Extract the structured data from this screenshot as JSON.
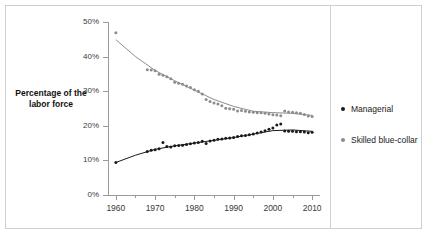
{
  "title_fragment": "UNEQUAL",
  "y_axis_title": "Percentage of the labor force",
  "legend": {
    "items": [
      {
        "label": "Managerial",
        "color": "#1a1a1a",
        "marker": "dot-marker"
      },
      {
        "label": "Skilled blue-collar",
        "color": "#8c8c8c",
        "marker": "dot-marker"
      }
    ]
  },
  "chart_data": {
    "type": "scatter",
    "title": "",
    "xlabel": "",
    "ylabel": "Percentage of the labor force",
    "xlim": [
      1958,
      2012
    ],
    "ylim": [
      0,
      50
    ],
    "grid": false,
    "legend_position": "right",
    "x_ticks": [
      1960,
      1970,
      1980,
      1990,
      2000,
      2010
    ],
    "x_tick_labels": [
      "1960",
      "1970",
      "1980",
      "1990",
      "2000",
      "2010"
    ],
    "x_minor_ticks": [
      1965,
      1975,
      1985,
      1995,
      2005
    ],
    "y_ticks": [
      0,
      10,
      20,
      30,
      40,
      50
    ],
    "y_tick_labels": [
      "0%",
      "10%",
      "20%",
      "30%",
      "40%",
      "50%"
    ],
    "series": [
      {
        "name": "Skilled blue-collar",
        "color": "#8c8c8c",
        "marker": "dot",
        "trend_line": true,
        "points": [
          {
            "x": 1960,
            "y": 46.9
          },
          {
            "x": 1968,
            "y": 36.2
          },
          {
            "x": 1969,
            "y": 36.1
          },
          {
            "x": 1970,
            "y": 35.9
          },
          {
            "x": 1971,
            "y": 34.9
          },
          {
            "x": 1972,
            "y": 34.6
          },
          {
            "x": 1973,
            "y": 34.2
          },
          {
            "x": 1974,
            "y": 33.6
          },
          {
            "x": 1975,
            "y": 32.6
          },
          {
            "x": 1976,
            "y": 32.3
          },
          {
            "x": 1977,
            "y": 32.0
          },
          {
            "x": 1978,
            "y": 31.5
          },
          {
            "x": 1979,
            "y": 31.1
          },
          {
            "x": 1980,
            "y": 30.4
          },
          {
            "x": 1981,
            "y": 30.0
          },
          {
            "x": 1982,
            "y": 29.2
          },
          {
            "x": 1983,
            "y": 27.6
          },
          {
            "x": 1984,
            "y": 27.0
          },
          {
            "x": 1985,
            "y": 26.6
          },
          {
            "x": 1986,
            "y": 26.3
          },
          {
            "x": 1987,
            "y": 25.8
          },
          {
            "x": 1988,
            "y": 25.1
          },
          {
            "x": 1989,
            "y": 24.9
          },
          {
            "x": 1990,
            "y": 24.8
          },
          {
            "x": 1991,
            "y": 24.3
          },
          {
            "x": 1992,
            "y": 24.4
          },
          {
            "x": 1993,
            "y": 24.2
          },
          {
            "x": 1994,
            "y": 24.0
          },
          {
            "x": 1995,
            "y": 23.9
          },
          {
            "x": 1996,
            "y": 23.8
          },
          {
            "x": 1997,
            "y": 23.8
          },
          {
            "x": 1998,
            "y": 23.6
          },
          {
            "x": 1999,
            "y": 23.4
          },
          {
            "x": 2000,
            "y": 23.2
          },
          {
            "x": 2001,
            "y": 23.1
          },
          {
            "x": 2002,
            "y": 22.9
          },
          {
            "x": 2003,
            "y": 24.3
          },
          {
            "x": 2004,
            "y": 24.0
          },
          {
            "x": 2005,
            "y": 23.9
          },
          {
            "x": 2006,
            "y": 23.8
          },
          {
            "x": 2007,
            "y": 23.6
          },
          {
            "x": 2008,
            "y": 23.3
          },
          {
            "x": 2009,
            "y": 22.8
          },
          {
            "x": 2010,
            "y": 22.7
          }
        ]
      },
      {
        "name": "Managerial",
        "color": "#1a1a1a",
        "marker": "dot",
        "trend_line": true,
        "points": [
          {
            "x": 1960,
            "y": 9.4
          },
          {
            "x": 1968,
            "y": 12.6
          },
          {
            "x": 1969,
            "y": 12.9
          },
          {
            "x": 1970,
            "y": 13.1
          },
          {
            "x": 1971,
            "y": 13.4
          },
          {
            "x": 1972,
            "y": 15.2
          },
          {
            "x": 1973,
            "y": 14.0
          },
          {
            "x": 1974,
            "y": 13.9
          },
          {
            "x": 1975,
            "y": 14.2
          },
          {
            "x": 1976,
            "y": 14.3
          },
          {
            "x": 1977,
            "y": 14.4
          },
          {
            "x": 1978,
            "y": 14.6
          },
          {
            "x": 1979,
            "y": 14.8
          },
          {
            "x": 1980,
            "y": 15.0
          },
          {
            "x": 1981,
            "y": 15.2
          },
          {
            "x": 1982,
            "y": 15.5
          },
          {
            "x": 1983,
            "y": 14.9
          },
          {
            "x": 1984,
            "y": 15.6
          },
          {
            "x": 1985,
            "y": 15.8
          },
          {
            "x": 1986,
            "y": 16.1
          },
          {
            "x": 1987,
            "y": 16.2
          },
          {
            "x": 1988,
            "y": 16.4
          },
          {
            "x": 1989,
            "y": 16.5
          },
          {
            "x": 1990,
            "y": 16.6
          },
          {
            "x": 1991,
            "y": 16.9
          },
          {
            "x": 1992,
            "y": 17.1
          },
          {
            "x": 1993,
            "y": 17.2
          },
          {
            "x": 1994,
            "y": 17.4
          },
          {
            "x": 1995,
            "y": 17.6
          },
          {
            "x": 1996,
            "y": 17.9
          },
          {
            "x": 1997,
            "y": 18.2
          },
          {
            "x": 1998,
            "y": 18.6
          },
          {
            "x": 1999,
            "y": 19.0
          },
          {
            "x": 2000,
            "y": 19.4
          },
          {
            "x": 2001,
            "y": 20.2
          },
          {
            "x": 2002,
            "y": 20.5
          },
          {
            "x": 2003,
            "y": 18.5
          },
          {
            "x": 2004,
            "y": 18.4
          },
          {
            "x": 2005,
            "y": 18.4
          },
          {
            "x": 2006,
            "y": 18.3
          },
          {
            "x": 2007,
            "y": 18.3
          },
          {
            "x": 2008,
            "y": 18.2
          },
          {
            "x": 2009,
            "y": 18.0
          },
          {
            "x": 2010,
            "y": 18.1
          }
        ]
      }
    ],
    "trend_lines": [
      {
        "name": "Skilled blue-collar trend",
        "color": "#8c8c8c",
        "points": [
          {
            "x": 1960,
            "y": 44.9
          },
          {
            "x": 1965,
            "y": 40.0
          },
          {
            "x": 1970,
            "y": 36.0
          },
          {
            "x": 1975,
            "y": 33.0
          },
          {
            "x": 1980,
            "y": 30.3
          },
          {
            "x": 1985,
            "y": 27.6
          },
          {
            "x": 1990,
            "y": 25.6
          },
          {
            "x": 1995,
            "y": 24.2
          },
          {
            "x": 2000,
            "y": 23.8
          },
          {
            "x": 2005,
            "y": 23.6
          },
          {
            "x": 2010,
            "y": 23.0
          }
        ]
      },
      {
        "name": "Managerial trend",
        "color": "#1a1a1a",
        "points": [
          {
            "x": 1960,
            "y": 9.4
          },
          {
            "x": 1965,
            "y": 11.5
          },
          {
            "x": 1970,
            "y": 13.2
          },
          {
            "x": 1975,
            "y": 14.2
          },
          {
            "x": 1980,
            "y": 15.0
          },
          {
            "x": 1985,
            "y": 15.8
          },
          {
            "x": 1990,
            "y": 16.6
          },
          {
            "x": 1995,
            "y": 17.6
          },
          {
            "x": 2000,
            "y": 18.6
          },
          {
            "x": 2005,
            "y": 18.8
          },
          {
            "x": 2010,
            "y": 18.4
          }
        ]
      }
    ]
  }
}
